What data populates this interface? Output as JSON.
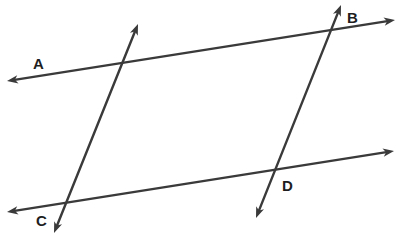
{
  "diagram": {
    "type": "geometry-lines",
    "colors": {
      "stroke": "#3a3a3a",
      "label": "#1e1e1e",
      "background": "#ffffff"
    },
    "lines": [
      {
        "id": "line-top",
        "x1": 7,
        "y1": 81,
        "x2": 395,
        "y2": 20,
        "arrows": "both"
      },
      {
        "id": "line-bottom",
        "x1": 7,
        "y1": 212,
        "x2": 394,
        "y2": 151,
        "arrows": "both"
      },
      {
        "id": "transversal-left",
        "x1": 138,
        "y1": 24,
        "x2": 54,
        "y2": 233,
        "arrows": "both"
      },
      {
        "id": "transversal-right",
        "x1": 341,
        "y1": 5,
        "x2": 256,
        "y2": 218,
        "arrows": "both"
      }
    ],
    "labels": [
      {
        "id": "label-a",
        "text": "A",
        "x": 33,
        "y": 69
      },
      {
        "id": "label-b",
        "text": "B",
        "x": 347,
        "y": 23
      },
      {
        "id": "label-c",
        "text": "C",
        "x": 36,
        "y": 226
      },
      {
        "id": "label-d",
        "text": "D",
        "x": 282,
        "y": 191
      }
    ]
  }
}
